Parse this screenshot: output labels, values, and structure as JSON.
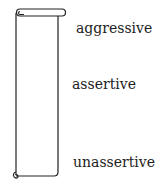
{
  "diagram": {
    "type": "scroll-scale",
    "labels": {
      "top": "aggressive",
      "middle": "assertive",
      "bottom": "unassertive"
    }
  }
}
